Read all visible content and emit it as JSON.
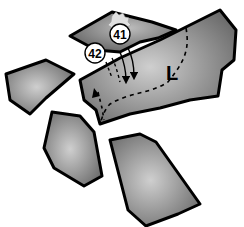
{
  "diagram": {
    "labels": {
      "marker_41": "41",
      "marker_42": "42",
      "letter_L": "L"
    },
    "colors": {
      "plate_light": "#c8c8c8",
      "plate_dark": "#6e6e6e",
      "outline": "#000000",
      "marker_fill": "#ffffff",
      "splat": "#d8d8d8"
    }
  }
}
